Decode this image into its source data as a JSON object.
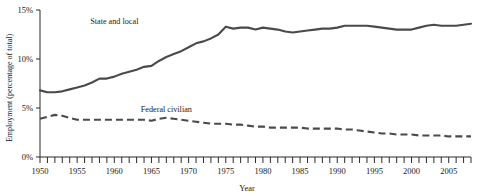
{
  "chart_data": {
    "type": "line",
    "title": "",
    "xlabel": "Year",
    "ylabel": "Employment (percentage of total)",
    "xlim": [
      1950,
      2008
    ],
    "ylim": [
      0,
      15
    ],
    "yticks": [
      0,
      5,
      10,
      15
    ],
    "ytick_labels": [
      "0%",
      "5%",
      "10%",
      "15%"
    ],
    "xticks": [
      1950,
      1955,
      1960,
      1965,
      1970,
      1975,
      1980,
      1985,
      1990,
      1995,
      2000,
      2005
    ],
    "xtick_labels": [
      "1950",
      "1955",
      "1960",
      "1965",
      "1970",
      "1975",
      "1980",
      "1985",
      "1990",
      "1995",
      "2000",
      "2005"
    ],
    "x_minor_tick_interval": 1,
    "grid": false,
    "legend": "inline-annotations",
    "x": [
      1950,
      1951,
      1952,
      1953,
      1954,
      1955,
      1956,
      1957,
      1958,
      1959,
      1960,
      1961,
      1962,
      1963,
      1964,
      1965,
      1966,
      1967,
      1968,
      1969,
      1970,
      1971,
      1972,
      1973,
      1974,
      1975,
      1976,
      1977,
      1978,
      1979,
      1980,
      1981,
      1982,
      1983,
      1984,
      1985,
      1986,
      1987,
      1988,
      1989,
      1990,
      1991,
      1992,
      1993,
      1994,
      1995,
      1996,
      1997,
      1998,
      1999,
      2000,
      2001,
      2002,
      2003,
      2004,
      2005,
      2006,
      2007,
      2008
    ],
    "series": [
      {
        "name": "State and local",
        "style": "solid",
        "color": "#4a4a4a",
        "label_x": 1960,
        "label_y": 13.6,
        "values": [
          6.8,
          6.6,
          6.6,
          6.7,
          6.9,
          7.1,
          7.3,
          7.6,
          8.0,
          8.0,
          8.2,
          8.5,
          8.7,
          8.9,
          9.2,
          9.3,
          9.8,
          10.2,
          10.5,
          10.8,
          11.2,
          11.6,
          11.8,
          12.1,
          12.5,
          13.3,
          13.1,
          13.2,
          13.2,
          13.0,
          13.2,
          13.1,
          13.0,
          12.8,
          12.7,
          12.8,
          12.9,
          13.0,
          13.1,
          13.1,
          13.2,
          13.4,
          13.4,
          13.4,
          13.4,
          13.3,
          13.2,
          13.1,
          13.0,
          13.0,
          13.0,
          13.2,
          13.4,
          13.5,
          13.4,
          13.4,
          13.4,
          13.5,
          13.6
        ]
      },
      {
        "name": "Federal civilian",
        "style": "dashed",
        "color": "#4a4a4a",
        "label_x": 1967,
        "label_y": 4.6,
        "values": [
          3.9,
          4.1,
          4.3,
          4.2,
          4.0,
          3.8,
          3.8,
          3.8,
          3.8,
          3.8,
          3.8,
          3.8,
          3.8,
          3.8,
          3.8,
          3.7,
          3.9,
          4.0,
          3.9,
          3.8,
          3.7,
          3.6,
          3.5,
          3.4,
          3.4,
          3.4,
          3.3,
          3.3,
          3.2,
          3.1,
          3.1,
          3.0,
          3.0,
          3.0,
          3.0,
          3.0,
          2.9,
          2.9,
          2.9,
          2.9,
          2.9,
          2.8,
          2.8,
          2.7,
          2.6,
          2.5,
          2.4,
          2.4,
          2.3,
          2.3,
          2.3,
          2.2,
          2.2,
          2.2,
          2.2,
          2.1,
          2.1,
          2.1,
          2.1
        ]
      }
    ]
  }
}
